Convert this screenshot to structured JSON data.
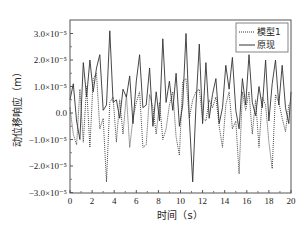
{
  "chart_data": {
    "type": "line",
    "title": "",
    "xlabel": "时间（s）",
    "ylabel": "动位移响应（m）",
    "xlim": [
      0,
      20
    ],
    "ylim": [
      -3e-05,
      3.5e-05
    ],
    "grid": false,
    "legend_position": "top-right",
    "x_ticks": [
      0,
      2,
      4,
      6,
      8,
      10,
      12,
      14,
      16,
      18,
      20
    ],
    "x_tick_labels": [
      "0",
      "2",
      "4",
      "6",
      "8",
      "10",
      "12",
      "14",
      "16",
      "18",
      "20"
    ],
    "y_ticks": [
      3e-05,
      2e-05,
      1e-05,
      0,
      -1e-05,
      -2e-05,
      -3e-05
    ],
    "y_tick_labels": [
      "3.0×10⁻⁵",
      "2.0×10⁻⁵",
      "1.0×10⁻⁵",
      "0.0",
      "−1.0×10⁻⁵",
      "−2.0×10⁻⁵",
      "−3.0×10⁻⁵"
    ],
    "x": [
      0,
      0.3,
      0.6,
      0.9,
      1.2,
      1.5,
      1.8,
      2.1,
      2.4,
      2.7,
      3.0,
      3.3,
      3.6,
      3.9,
      4.2,
      4.5,
      4.8,
      5.1,
      5.4,
      5.7,
      6.0,
      6.3,
      6.6,
      6.9,
      7.2,
      7.5,
      7.8,
      8.1,
      8.4,
      8.7,
      9.0,
      9.3,
      9.6,
      9.9,
      10.2,
      10.5,
      10.8,
      11.1,
      11.4,
      11.7,
      12.0,
      12.3,
      12.6,
      12.9,
      13.2,
      13.5,
      13.8,
      14.1,
      14.4,
      14.7,
      15.0,
      15.3,
      15.6,
      15.9,
      16.2,
      16.5,
      16.8,
      17.1,
      17.4,
      17.7,
      18.0,
      18.3,
      18.6,
      18.9,
      19.2,
      19.5,
      19.8,
      20.0
    ],
    "series": [
      {
        "name": "模型1",
        "style": "dotted",
        "values": [
          2e-06,
          -8e-06,
          -1.2e-05,
          9e-06,
          -1.1e-05,
          1e-05,
          -1.3e-05,
          1.3e-05,
          1.5e-05,
          -6e-06,
          -2e-06,
          -2.6e-05,
          4e-06,
          6e-06,
          -1.1e-05,
          5e-06,
          -8e-06,
          7e-06,
          -1.3e-05,
          -2e-06,
          4e-06,
          8e-06,
          -1.3e-05,
          -1.2e-05,
          7e-06,
          2e-06,
          -8e-06,
          4e-06,
          -1e-05,
          -6e-06,
          3e-06,
          8e-06,
          -9e-06,
          -1.6e-05,
          1.2e-05,
          1.3e-05,
          -2e-06,
          5e-06,
          8e-06,
          9e-06,
          -2e-06,
          -3e-06,
          5e-06,
          2e-06,
          6e-06,
          -5e-06,
          -1.3e-05,
          3e-06,
          8e-06,
          -6e-06,
          -3e-06,
          -2.3e-05,
          8e-06,
          1e-06,
          8e-06,
          -8e-06,
          5e-06,
          -1.3e-05,
          6e-06,
          3e-06,
          -1.1e-05,
          -2.1e-05,
          7e-06,
          4e-06,
          -2e-06,
          -7e-06,
          3e-06,
          4e-06
        ]
      },
      {
        "name": "原现",
        "style": "solid",
        "values": [
          5e-06,
          1.1e-05,
          -3e-06,
          -1e-05,
          1.9e-05,
          6e-06,
          2e-05,
          8e-06,
          1.7e-05,
          2.2e-05,
          1e-06,
          3e-06,
          3.1e-05,
          4e-06,
          5e-06,
          -2e-06,
          9e-06,
          6e-06,
          1.4e-05,
          -4e-06,
          1.2e-05,
          2.2e-05,
          2e-06,
          3e-06,
          1.7e-05,
          -5e-06,
          8e-06,
          -3e-06,
          2.8e-05,
          4e-06,
          1.2e-05,
          1e-06,
          1.5e-05,
          -5e-06,
          3e-06,
          3e-05,
          -2e-06,
          -2.6e-05,
          3e-06,
          2.6e-05,
          -4e-06,
          1.9e-05,
          -2e-06,
          7e-06,
          1.3e-05,
          -4e-06,
          2e-06,
          1.8e-05,
          9e-06,
          2.1e-05,
          1e-06,
          -6e-06,
          1.3e-05,
          3e-06,
          2.2e-05,
          4e-06,
          -1e-06,
          1e-05,
          2e-06,
          2e-05,
          -3e-06,
          1.1e-05,
          2e-05,
          3e-06,
          1.8e-05,
          2e-06,
          -4e-06,
          8e-06
        ]
      }
    ]
  },
  "legend": {
    "items": [
      "模型1",
      "原现"
    ]
  }
}
